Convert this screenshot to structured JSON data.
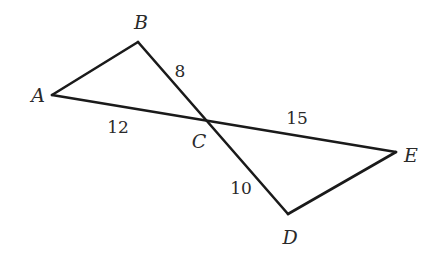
{
  "diagram": {
    "type": "geometry-two-triangles-vertical-angles",
    "vertices": {
      "A": {
        "label": "A",
        "x": 52,
        "y": 95,
        "label_x": 38,
        "label_y": 102
      },
      "B": {
        "label": "B",
        "x": 138,
        "y": 42,
        "label_x": 141,
        "label_y": 29
      },
      "C": {
        "label": "C",
        "x": 206,
        "y": 120,
        "label_x": 199,
        "label_y": 148
      },
      "D": {
        "label": "D",
        "x": 288,
        "y": 214,
        "label_x": 290,
        "label_y": 244
      },
      "E": {
        "label": "E",
        "x": 396,
        "y": 152,
        "label_x": 411,
        "label_y": 162
      }
    },
    "segments": [
      {
        "from": "A",
        "to": "B"
      },
      {
        "from": "B",
        "to": "D"
      },
      {
        "from": "A",
        "to": "E"
      },
      {
        "from": "D",
        "to": "E"
      }
    ],
    "measurements": [
      {
        "segment": "BC",
        "value": "8",
        "x": 180,
        "y": 77
      },
      {
        "segment": "AC",
        "value": "12",
        "x": 118,
        "y": 133
      },
      {
        "segment": "CE",
        "value": "15",
        "x": 297,
        "y": 124
      },
      {
        "segment": "CD",
        "value": "10",
        "x": 241,
        "y": 194
      }
    ],
    "line_color": "#1a1a1a",
    "text_color": "#2a2a2a",
    "background": "#ffffff"
  }
}
